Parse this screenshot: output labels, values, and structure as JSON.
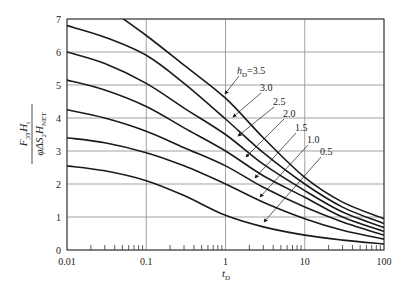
{
  "chart_data": {
    "type": "line",
    "title": "",
    "xlabel": "t_D",
    "ylabel": "F_3T H_t / (φ ΔS_2 H_NET)",
    "xscale": "log",
    "xlim": [
      0.01,
      100
    ],
    "ylim": [
      0,
      7
    ],
    "grid": true,
    "x_ticks": [
      "0.01",
      "0.1",
      "1",
      "10",
      "100"
    ],
    "y_ticks": [
      "0",
      "1",
      "2",
      "3",
      "4",
      "5",
      "6",
      "7"
    ],
    "legend_position": "inline labels with arrows",
    "x": [
      0.01,
      0.03,
      0.1,
      0.3,
      1,
      3,
      10,
      30,
      100
    ],
    "series": [
      {
        "name": "h_D=3.5",
        "label": "h_D=3.5",
        "values": [
          8.2,
          7.4,
          6.5,
          5.6,
          4.6,
          3.4,
          2.2,
          1.45,
          0.95
        ]
      },
      {
        "name": "3.0",
        "label": "3.0",
        "values": [
          6.8,
          6.45,
          5.9,
          5.05,
          3.97,
          2.95,
          2.0,
          1.3,
          0.8
        ]
      },
      {
        "name": "2.5",
        "label": "2.5",
        "values": [
          6.0,
          5.65,
          5.05,
          4.3,
          3.5,
          2.6,
          1.8,
          1.15,
          0.68
        ]
      },
      {
        "name": "2.0",
        "label": "2.0",
        "values": [
          5.15,
          4.85,
          4.35,
          3.7,
          3.0,
          2.25,
          1.6,
          1.0,
          0.56
        ]
      },
      {
        "name": "1.5",
        "label": "1.5",
        "values": [
          4.25,
          4.0,
          3.6,
          3.1,
          2.55,
          1.9,
          1.3,
          0.85,
          0.45
        ]
      },
      {
        "name": "1.0",
        "label": "1.0",
        "values": [
          3.4,
          3.25,
          2.95,
          2.55,
          2.0,
          1.45,
          0.95,
          0.6,
          0.33
        ]
      },
      {
        "name": "0.5",
        "label": "0.5",
        "values": [
          2.55,
          2.4,
          2.1,
          1.65,
          1.05,
          0.7,
          0.45,
          0.3,
          0.18
        ]
      }
    ],
    "annotations": [
      {
        "text": "h",
        "sub": "D",
        "suffix": "=3.5",
        "x": 237,
        "y": 74,
        "arrow_to": [
          225,
          94
        ]
      },
      {
        "text": "3.0",
        "x": 260,
        "y": 91,
        "arrow_to": [
          233,
          117
        ]
      },
      {
        "text": "2.5",
        "x": 273,
        "y": 105,
        "arrow_to": [
          238,
          136
        ]
      },
      {
        "text": "2.0",
        "x": 283,
        "y": 117,
        "arrow_to": [
          246,
          157
        ]
      },
      {
        "text": "1.5",
        "x": 295,
        "y": 131,
        "arrow_to": [
          255,
          178
        ]
      },
      {
        "text": "1.0",
        "x": 307,
        "y": 143,
        "arrow_to": [
          260,
          197
        ]
      },
      {
        "text": "0.5",
        "x": 320,
        "y": 155,
        "arrow_to": [
          264,
          222
        ]
      }
    ]
  },
  "axis": {
    "x_label_main": "t",
    "x_label_sub": "D",
    "y_label_num_main": "F",
    "y_label_num_sub1": "3T",
    "y_label_num_h": "H",
    "y_label_num_sub2": "t",
    "y_label_den_main": "φΔS",
    "y_label_den_sub1": "2",
    "y_label_den_h": "H",
    "y_label_den_sub2": "NET"
  },
  "colors": {
    "curve": "#1a1a1a",
    "grid": "#8a8a8a",
    "frame": "#333333",
    "text": "#222222"
  }
}
